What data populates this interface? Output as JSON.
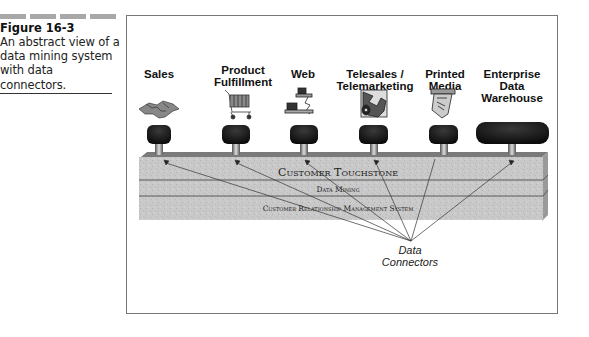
{
  "caption": {
    "figure_number": "Figure 16-3",
    "lines": [
      "An abstract view of a",
      "data mining system",
      "with data",
      "connectors."
    ]
  },
  "diagram": {
    "sources": [
      {
        "label_lines": [
          "Sales"
        ],
        "icon": "handshake-icon"
      },
      {
        "label_lines": [
          "Product",
          "Fulfillment"
        ],
        "icon": "shopping-cart-icon"
      },
      {
        "label_lines": [
          "Web"
        ],
        "icon": "computer-network-icon"
      },
      {
        "label_lines": [
          "Telesales /",
          "Telemarketing"
        ],
        "icon": "telephone-operator-icon"
      },
      {
        "label_lines": [
          "Printed",
          "Media"
        ],
        "icon": "printed-document-icon"
      },
      {
        "label_lines": [
          "Enterprise",
          "Data",
          "Warehouse"
        ],
        "icon": "database-icon"
      }
    ],
    "layers": {
      "top": "Customer Touchstone",
      "middle": "Data Mining",
      "bottom": "Customer Relationship Management System"
    },
    "connector_label": [
      "Data",
      "Connectors"
    ]
  }
}
